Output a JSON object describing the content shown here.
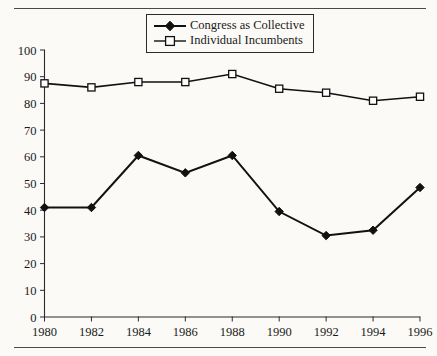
{
  "figure": {
    "background_color": "#fbfaf7",
    "line_color": "#111111",
    "rule_color": "#4a4a46"
  },
  "legend": {
    "position": "top-center",
    "entries": [
      {
        "label": "Congress as Collective",
        "marker": "filled-diamond",
        "marker_name": "diamond-marker-icon"
      },
      {
        "label": "Individual Incumbents",
        "marker": "open-square",
        "marker_name": "square-marker-icon"
      }
    ]
  },
  "chart_data": {
    "type": "line",
    "title": "",
    "subtitle": "",
    "xlabel": "",
    "ylabel": "",
    "x": [
      1980,
      1982,
      1984,
      1986,
      1988,
      1990,
      1992,
      1994,
      1996
    ],
    "categories": [
      "1980",
      "1982",
      "1984",
      "1986",
      "1988",
      "1990",
      "1992",
      "1994",
      "1996"
    ],
    "xlim": [
      1980,
      1996
    ],
    "ylim": [
      0,
      100
    ],
    "ytick_labels": [
      "0",
      "10",
      "20",
      "30",
      "40",
      "50",
      "60",
      "70",
      "80",
      "90",
      "100"
    ],
    "yticks": [
      0,
      10,
      20,
      30,
      40,
      50,
      60,
      70,
      80,
      90,
      100
    ],
    "xtick_labels": [
      "1980",
      "1982",
      "1984",
      "1986",
      "1988",
      "1990",
      "1992",
      "1994",
      "1996"
    ],
    "grid": false,
    "legend_position": "top-center",
    "series": [
      {
        "name": "Congress as Collective",
        "marker": "filled-diamond",
        "color": "#111111",
        "values": [
          41,
          41,
          60.5,
          54,
          60.5,
          39.5,
          30.5,
          32.5,
          48.5
        ]
      },
      {
        "name": "Individual Incumbents",
        "marker": "open-square",
        "color": "#111111",
        "values": [
          87.5,
          86,
          88,
          88,
          91,
          85.5,
          84,
          81,
          82.5
        ]
      }
    ],
    "annotations": []
  }
}
